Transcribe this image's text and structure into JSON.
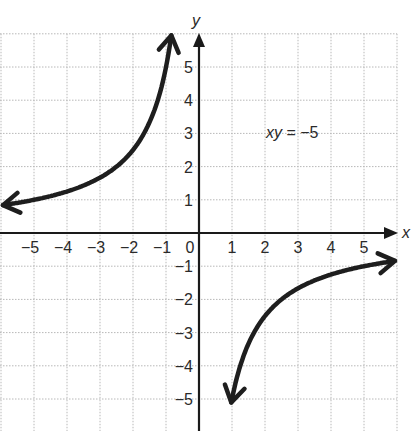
{
  "chart_data": {
    "type": "line",
    "title": "",
    "equation_label": "xy = −5",
    "equation_label_parts": {
      "vars": "xy",
      "rest": " = −5"
    },
    "function": "y = -5/x",
    "xlabel": "x",
    "ylabel": "y",
    "xlim": [
      -6,
      6
    ],
    "ylim": [
      -6,
      6
    ],
    "grid": true,
    "x_ticks": [
      -5,
      -4,
      -3,
      -2,
      -1,
      0,
      1,
      2,
      3,
      4,
      5
    ],
    "y_ticks": [
      -5,
      -4,
      -3,
      -2,
      -1,
      1,
      2,
      3,
      4,
      5
    ],
    "x_tick_labels": [
      "−5",
      "−4",
      "−3",
      "−2",
      "−1",
      "0",
      "1",
      "2",
      "3",
      "4",
      "5"
    ],
    "y_tick_labels": [
      "5",
      "4",
      "3",
      "2",
      "1",
      "−1",
      "−2",
      "−3",
      "−4",
      "−5"
    ],
    "series": [
      {
        "name": "branch-quadrant-II",
        "x": [
          -5.94,
          -5,
          -4,
          -3,
          -2.5,
          -2,
          -1.5,
          -1.25,
          -1,
          -0.91
        ],
        "y": [
          0.84,
          1,
          1.25,
          1.67,
          2,
          2.5,
          3.33,
          4,
          5,
          5.5
        ],
        "arrows": "both"
      },
      {
        "name": "branch-quadrant-IV",
        "x": [
          0.97,
          1,
          1.25,
          1.5,
          2,
          2.5,
          3,
          4,
          5,
          5.94
        ],
        "y": [
          -5.15,
          -5,
          -4,
          -3.33,
          -2.5,
          -2,
          -1.67,
          -1.25,
          -1,
          -0.84
        ],
        "arrows": "both"
      }
    ],
    "colors": {
      "curve": "#1e1e1e",
      "axis": "#1a1a1a",
      "grid": "#b8b8b8",
      "background": "#ffffff"
    }
  }
}
